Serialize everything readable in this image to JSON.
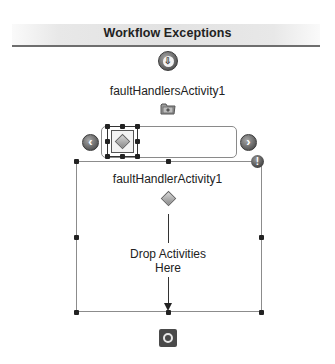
{
  "header": {
    "title": "Workflow Exceptions"
  },
  "start_connector": {
    "icon": "arrow-down-circle-icon",
    "glyph": "⇩"
  },
  "fault_handlers": {
    "label": "faultHandlersActivity1",
    "icon": "folder-icon"
  },
  "scroller": {
    "prev_glyph": "‹",
    "next_glyph": "›",
    "selected_item_icon": "fault-handler-diamond-icon"
  },
  "fault_handler": {
    "label": "faultHandlerActivity1",
    "icon": "fault-handler-diamond-icon",
    "warning_glyph": "!",
    "drop_line1": "Drop Activities",
    "drop_line2": "Here"
  },
  "end_connector": {
    "icon": "end-circle-icon"
  },
  "colors": {
    "header_line": "#6e6e6e",
    "frame_border": "#8c8c8c",
    "handle": "#222222",
    "end_button": "#4a4a4a"
  }
}
